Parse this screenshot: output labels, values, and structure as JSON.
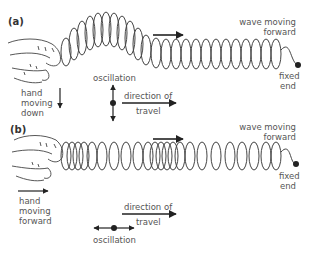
{
  "panels": {
    "a": {
      "label": "(a)",
      "wave_label": [
        "wave moving",
        "forward"
      ],
      "fixed_end": [
        "fixed",
        "end"
      ],
      "hand_label": [
        "hand",
        "moving",
        "down"
      ],
      "oscillation": "oscillation",
      "direction": [
        "direction of",
        "travel"
      ]
    },
    "b": {
      "label": "(b)",
      "wave_label": [
        "wave moving",
        "forward"
      ],
      "fixed_end": [
        "fixed",
        "end"
      ],
      "hand_label": [
        "hand",
        "moving",
        "forward"
      ],
      "oscillation": "oscillation",
      "direction": [
        "direction of",
        "travel"
      ]
    }
  },
  "colors": {
    "line": "#333333",
    "text": "#555555"
  }
}
